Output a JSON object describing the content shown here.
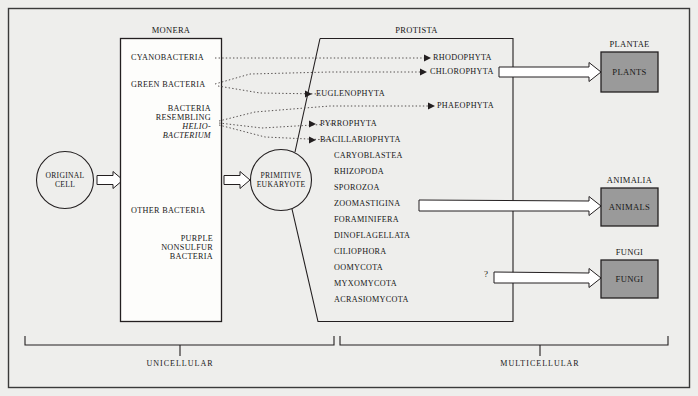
{
  "diagram": {
    "background_color": "#eeeeec",
    "line_color": "#231f20",
    "box_fill_color": "#9a9a9a"
  },
  "origin": {
    "line1": "ORIGINAL",
    "line2": "CELL"
  },
  "monera": {
    "title": "MONERA",
    "items": [
      {
        "text": "CYANOBACTERIA",
        "align": "left"
      },
      {
        "text": "GREEN BACTERIA",
        "align": "left"
      },
      {
        "text": "BACTERIA",
        "align": "right"
      },
      {
        "text": "RESEMBLING",
        "align": "right"
      },
      {
        "text": "HELIO-",
        "align": "right",
        "italic": true
      },
      {
        "text": "BACTERIUM",
        "align": "right",
        "italic": true
      },
      {
        "text": "OTHER BACTERIA",
        "align": "left"
      },
      {
        "text": "PURPLE",
        "align": "right"
      },
      {
        "text": "NONSULFUR",
        "align": "right"
      },
      {
        "text": "BACTERIA",
        "align": "right"
      }
    ]
  },
  "eukaryote": {
    "line1": "PRIMITIVE",
    "line2": "EUKARYOTE"
  },
  "protista": {
    "title": "PROTISTA",
    "items": [
      {
        "text": "RHODOPHYTA",
        "arrow": true
      },
      {
        "text": "CHLOROPHYTA",
        "arrow": true
      },
      {
        "text": "EUGLENOPHYTA",
        "arrow": true
      },
      {
        "text": "PHAEOPHYTA",
        "arrow": true
      },
      {
        "text": "PYRROPHYTA",
        "arrow": true
      },
      {
        "text": "BACILLARIOPHYTA",
        "arrow": true
      },
      {
        "text": "CARYOBLASTEA",
        "arrow": false
      },
      {
        "text": "RHIZOPODA",
        "arrow": false
      },
      {
        "text": "SPOROZOA",
        "arrow": false
      },
      {
        "text": "ZOOMASTIGINA",
        "arrow": false
      },
      {
        "text": "FORAMINIFERA",
        "arrow": false
      },
      {
        "text": "DINOFLAGELLATA",
        "arrow": false
      },
      {
        "text": "CILIOPHORA",
        "arrow": false
      },
      {
        "text": "OOMYCOTA",
        "arrow": false
      },
      {
        "text": "MYXOMYCOTA",
        "arrow": false
      },
      {
        "text": "ACRASIOMYCOTA",
        "arrow": false
      }
    ]
  },
  "kingdoms": [
    {
      "title": "PLANTAE",
      "box_label": "PLANTS"
    },
    {
      "title": "ANIMALIA",
      "box_label": "ANIMALS"
    },
    {
      "title": "FUNGI",
      "box_label": "FUNGI"
    }
  ],
  "uncertain_marker": "?",
  "brackets": [
    {
      "label": "UNICELLULAR"
    },
    {
      "label": "MULTICELLULAR"
    }
  ]
}
